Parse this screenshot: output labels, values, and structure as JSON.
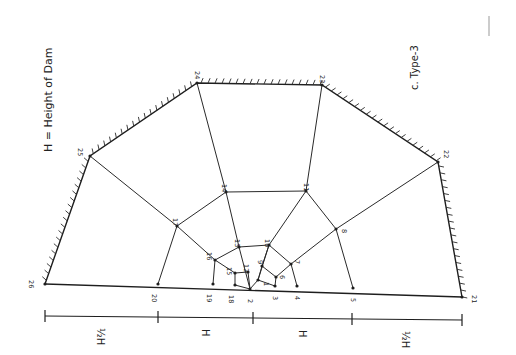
{
  "figure": {
    "caption_label": "c. Type-3",
    "legend": "H = Height of Dam",
    "ink_color": "#1e1e1e",
    "background": "#ffffff"
  },
  "nodes": [
    {
      "id": "1",
      "x": 258,
      "y": 280
    },
    {
      "id": "2",
      "x": 250,
      "y": 289
    },
    {
      "id": "3",
      "x": 275,
      "y": 286
    },
    {
      "id": "4",
      "x": 297,
      "y": 286
    },
    {
      "id": "5",
      "x": 353,
      "y": 288
    },
    {
      "id": "6",
      "x": 276,
      "y": 277
    },
    {
      "id": "7",
      "x": 291,
      "y": 264
    },
    {
      "id": "8",
      "x": 336,
      "y": 229
    },
    {
      "id": "9",
      "x": 262,
      "y": 266
    },
    {
      "id": "10",
      "x": 269,
      "y": 245
    },
    {
      "id": "11",
      "x": 306,
      "y": 191
    },
    {
      "id": "12",
      "x": 248,
      "y": 272
    },
    {
      "id": "13",
      "x": 239,
      "y": 247
    },
    {
      "id": "14",
      "x": 226,
      "y": 192
    },
    {
      "id": "15",
      "x": 235,
      "y": 273
    },
    {
      "id": "16",
      "x": 215,
      "y": 260
    },
    {
      "id": "17",
      "x": 177,
      "y": 226
    },
    {
      "id": "18",
      "x": 235,
      "y": 285
    },
    {
      "id": "19",
      "x": 213,
      "y": 284
    },
    {
      "id": "20",
      "x": 158,
      "y": 284
    },
    {
      "id": "21",
      "x": 462,
      "y": 297
    },
    {
      "id": "22",
      "x": 438,
      "y": 162
    },
    {
      "id": "23",
      "x": 322,
      "y": 85
    },
    {
      "id": "24",
      "x": 197,
      "y": 83
    },
    {
      "id": "25",
      "x": 90,
      "y": 156
    },
    {
      "id": "26",
      "x": 45,
      "y": 284
    }
  ],
  "dimension_line": {
    "segments": [
      {
        "label": "½H"
      },
      {
        "label": "H"
      },
      {
        "label": "H"
      },
      {
        "label": "½H"
      }
    ]
  }
}
